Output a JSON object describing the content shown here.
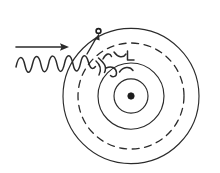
{
  "figure": {
    "caption": "",
    "background_color": "#ffffff",
    "ink_color": "#2b2b2b",
    "width": 220,
    "height": 173,
    "style": "hand-drawn sketch"
  },
  "atom": {
    "center": {
      "x": 131,
      "y": 96
    },
    "nucleus": {
      "label": "nucleus",
      "radius": 3.2,
      "color": "#1c1c1c"
    },
    "orbits": [
      {
        "name": "inner-orbit",
        "radius": 17,
        "style": "solid"
      },
      {
        "name": "middle-orbit",
        "radius": 33,
        "style": "solid"
      },
      {
        "name": "outer-orbit",
        "radius": 68,
        "style": "solid"
      },
      {
        "name": "excited-shell-orbit",
        "radius": 53,
        "style": "dashed"
      }
    ]
  },
  "electron": {
    "label": "electron",
    "position": {
      "x": 98,
      "y": 31
    },
    "radius": 2.6,
    "on_orbit": "outer-orbit"
  },
  "photon": {
    "label": "incoming photon",
    "direction_arrow": {
      "from": {
        "x": 16,
        "y": 47
      },
      "to": {
        "x": 68,
        "y": 47
      }
    },
    "wave": {
      "start_x": 16,
      "end_x": 96,
      "baseline_y": 64,
      "amplitude": 9,
      "wavelength": 14,
      "cycles": 5.7
    }
  },
  "excitation_arrow": {
    "label": "excitation transition arrow",
    "from": {
      "x": 88,
      "y": 52
    },
    "to": {
      "x": 99,
      "y": 34
    }
  },
  "scribbles": {
    "label": "hand-drawn annotation marks",
    "count": 6
  },
  "colors": {
    "ink": "#2b2b2b",
    "nucleus": "#1c1c1c",
    "background": "#ffffff"
  }
}
